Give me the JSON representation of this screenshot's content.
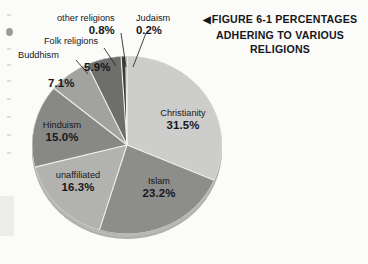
{
  "caption": {
    "marker": "◀",
    "text": "FIGURE 6-1 PERCENTAGES ADHERING TO VARIOUS RELIGIONS",
    "line1": "FIGURE 6-1 PERCENTAGES",
    "line2": "ADHERING TO VARIOUS",
    "line3": "RELIGIONS"
  },
  "chart_data": {
    "type": "pie",
    "title": "FIGURE 6-1 PERCENTAGES ADHERING TO VARIOUS RELIGIONS",
    "xlabel": "",
    "ylabel": "",
    "units": "percent",
    "start_angle_deg": -90,
    "direction": "clockwise",
    "legend": "none",
    "grid": false,
    "categories": [
      "Christianity",
      "Islam",
      "unaffiliated",
      "Hinduism",
      "Buddhism",
      "Folk religions",
      "other religions",
      "Judaism"
    ],
    "values": [
      31.5,
      23.2,
      16.3,
      15.0,
      7.1,
      5.9,
      0.8,
      0.2
    ],
    "labels": [
      "31.5%",
      "23.2%",
      "16.3%",
      "15.0%",
      "7.1%",
      "5.9%",
      "0.8%",
      "0.2%"
    ],
    "colors": [
      "#cdcdcb",
      "#8d8d8b",
      "#b2b2b0",
      "#888886",
      "#a2a2a0",
      "#6e6e6c",
      "#3a3a38",
      "#2a2a28"
    ],
    "slices": [
      {
        "name": "Christianity",
        "value": 31.5,
        "label": "31.5%",
        "color": "#cdcdcb",
        "label_placement": "inside"
      },
      {
        "name": "Islam",
        "value": 23.2,
        "label": "23.2%",
        "color": "#8d8d8b",
        "label_placement": "inside"
      },
      {
        "name": "unaffiliated",
        "value": 16.3,
        "label": "16.3%",
        "color": "#b2b2b0",
        "label_placement": "inside"
      },
      {
        "name": "Hinduism",
        "value": 15.0,
        "label": "15.0%",
        "color": "#888886",
        "label_placement": "inside"
      },
      {
        "name": "Buddhism",
        "value": 7.1,
        "label": "7.1%",
        "color": "#a2a2a0",
        "label_placement": "callout"
      },
      {
        "name": "Folk religions",
        "value": 5.9,
        "label": "5.9%",
        "color": "#6e6e6c",
        "label_placement": "callout"
      },
      {
        "name": "other religions",
        "value": 0.8,
        "label": "0.8%",
        "color": "#3a3a38",
        "label_placement": "callout"
      },
      {
        "name": "Judaism",
        "value": 0.2,
        "label": "0.2%",
        "color": "#2a2a28",
        "label_placement": "callout"
      }
    ]
  }
}
